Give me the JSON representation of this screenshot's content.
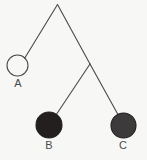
{
  "figure": {
    "background_color": "#f7f7f5",
    "width": 147,
    "height": 160,
    "line_color": "#4a4a4a",
    "line_width": 1.1
  },
  "pivot": {
    "name": "apex",
    "x": 57.5,
    "y": 4.5
  },
  "junction": {
    "name": "right-junction",
    "x": 90,
    "y": 64
  },
  "strings": [
    {
      "id": "apex-to-a",
      "from": "apex",
      "to": "A",
      "x1": 57.5,
      "y1": 4.5,
      "x2": 24.5,
      "y2": 58.5
    },
    {
      "id": "apex-to-junction",
      "from": "apex",
      "to": "right-junction",
      "x1": 57.5,
      "y1": 4.5,
      "x2": 90,
      "y2": 64
    },
    {
      "id": "junction-to-b",
      "from": "right-junction",
      "to": "B",
      "x1": 90,
      "y1": 64,
      "x2": 56,
      "y2": 115
    },
    {
      "id": "junction-to-c",
      "from": "right-junction",
      "to": "C",
      "x1": 90,
      "y1": 64,
      "x2": 118.5,
      "y2": 115.5
    }
  ],
  "nodes": [
    {
      "id": "A",
      "label": "A",
      "cx": 17.5,
      "cy": 65.5,
      "r": 10.5,
      "fill": "none",
      "fill_style": "open",
      "stroke": "#4a4a4a",
      "label_x": 18,
      "label_y": 84
    },
    {
      "id": "B",
      "label": "B",
      "cx": 49,
      "cy": 125,
      "r": 13,
      "fill": "#231f1f",
      "fill_style": "solid",
      "stroke": "#231f1f",
      "label_x": 49,
      "label_y": 146
    },
    {
      "id": "C",
      "label": "C",
      "cx": 123.5,
      "cy": 125.5,
      "r": 12.5,
      "fill": "#3c3a3a",
      "fill_style": "solid",
      "stroke": "#231f1f",
      "label_x": 123,
      "label_y": 146
    }
  ]
}
